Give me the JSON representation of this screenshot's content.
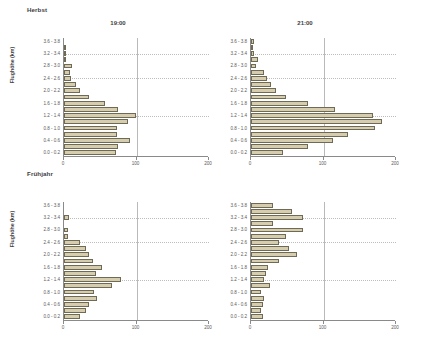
{
  "figure": {
    "background": "#ffffff",
    "bar_fill": "#d6cdae",
    "bar_stroke": "#6f6a55",
    "grid_color": "#bdbdbd",
    "axis_color": "#8a8a8a",
    "axis_title": "Flughöhe (km)"
  },
  "rows": [
    {
      "season_label": "Herbst"
    },
    {
      "season_label": "Frühjahr"
    }
  ],
  "panel_titles": {
    "time_1": "19:00",
    "time_2": "21:00"
  },
  "y_categories": [
    "3.6 - 3.8",
    "3.4 - 3.6",
    "3.2 - 3.4",
    "3.0 - 3.2",
    "2.8 - 3.0",
    "2.6 - 2.8",
    "2.4 - 2.6",
    "2.2 - 2.4",
    "2.0 - 2.2",
    "1.8 - 2.0",
    "1.6 - 1.8",
    "1.4 - 1.6",
    "1.2 - 1.4",
    "1.0 - 1.2",
    "0.8 - 1.0",
    "0.6 - 0.8",
    "0.4 - 0.6",
    "0.2 - 0.4",
    "0.0 - 0.2"
  ],
  "y_tick_labels": [
    "3.6 - 3.8",
    "3.2 - 3.4",
    "2.8 - 3.0",
    "2.4 - 2.6",
    "2.0 - 2.2",
    "1.6 - 1.8",
    "1.2 - 1.4",
    "0.8 - 1.0",
    "0.4 - 0.6",
    "0.0 - 0.2"
  ],
  "x_ticks": [
    0,
    100,
    200
  ],
  "x_tick_labels": [
    "0",
    "100",
    "200"
  ],
  "chart_data": [
    {
      "type": "bar",
      "orientation": "horizontal",
      "title": "19:00",
      "group": "Herbst",
      "xlabel": "",
      "ylabel": "Flughöhe (km)",
      "xlim": [
        0,
        200
      ],
      "grid": true,
      "categories": [
        "3.6 - 3.8",
        "3.4 - 3.6",
        "3.2 - 3.4",
        "3.0 - 3.2",
        "2.8 - 3.0",
        "2.6 - 2.8",
        "2.4 - 2.6",
        "2.2 - 2.4",
        "2.0 - 2.2",
        "1.8 - 2.0",
        "1.6 - 1.8",
        "1.4 - 1.6",
        "1.2 - 1.4",
        "1.0 - 1.2",
        "0.8 - 1.0",
        "0.6 - 0.8",
        "0.4 - 0.6",
        "0.2 - 0.4",
        "0.0 - 0.2"
      ],
      "values": [
        0,
        2,
        3,
        1,
        11,
        8,
        9,
        16,
        22,
        34,
        56,
        75,
        99,
        88,
        73,
        73,
        91,
        75,
        72
      ]
    },
    {
      "type": "bar",
      "orientation": "horizontal",
      "title": "21:00",
      "group": "Herbst",
      "xlabel": "",
      "ylabel": "",
      "xlim": [
        0,
        200
      ],
      "grid": true,
      "categories": [
        "3.6 - 3.8",
        "3.4 - 3.6",
        "3.2 - 3.4",
        "3.0 - 3.2",
        "2.8 - 3.0",
        "2.6 - 2.8",
        "2.4 - 2.6",
        "2.2 - 2.4",
        "2.0 - 2.2",
        "1.8 - 2.0",
        "1.6 - 1.8",
        "1.4 - 1.6",
        "1.2 - 1.4",
        "1.0 - 1.2",
        "0.8 - 1.0",
        "0.6 - 0.8",
        "0.4 - 0.6",
        "0.2 - 0.4",
        "0.0 - 0.2"
      ],
      "values": [
        4,
        2,
        4,
        10,
        7,
        18,
        22,
        27,
        35,
        48,
        78,
        116,
        168,
        180,
        171,
        134,
        113,
        79,
        44
      ]
    },
    {
      "type": "bar",
      "orientation": "horizontal",
      "title": "19:00",
      "group": "Frühjahr",
      "xlabel": "",
      "ylabel": "Flughöhe (km)",
      "xlim": [
        0,
        200
      ],
      "grid": true,
      "categories": [
        "3.6 - 3.8",
        "3.4 - 3.6",
        "3.2 - 3.4",
        "3.0 - 3.2",
        "2.8 - 3.0",
        "2.6 - 2.8",
        "2.4 - 2.6",
        "2.2 - 2.4",
        "2.0 - 2.2",
        "1.8 - 2.0",
        "1.6 - 1.8",
        "1.4 - 1.6",
        "1.2 - 1.4",
        "1.0 - 1.2",
        "0.8 - 1.0",
        "0.6 - 0.8",
        "0.4 - 0.6",
        "0.2 - 0.4",
        "0.0 - 0.2"
      ],
      "values": [
        0,
        0,
        7,
        0,
        5,
        6,
        22,
        30,
        34,
        40,
        52,
        44,
        78,
        66,
        41,
        45,
        35,
        30,
        22
      ]
    },
    {
      "type": "bar",
      "orientation": "horizontal",
      "title": "21:00",
      "group": "Frühjahr",
      "xlabel": "",
      "ylabel": "",
      "xlim": [
        0,
        200
      ],
      "grid": true,
      "categories": [
        "3.6 - 3.8",
        "3.4 - 3.6",
        "3.2 - 3.4",
        "3.0 - 3.2",
        "2.8 - 3.0",
        "2.6 - 2.8",
        "2.4 - 2.6",
        "2.2 - 2.4",
        "2.0 - 2.2",
        "1.8 - 2.0",
        "1.6 - 1.8",
        "1.4 - 1.6",
        "1.2 - 1.4",
        "1.0 - 1.2",
        "0.8 - 1.0",
        "0.6 - 0.8",
        "0.4 - 0.6",
        "0.2 - 0.4",
        "0.0 - 0.2"
      ],
      "values": [
        30,
        56,
        72,
        30,
        72,
        48,
        38,
        52,
        64,
        38,
        24,
        20,
        18,
        26,
        14,
        18,
        16,
        14,
        16
      ]
    }
  ]
}
